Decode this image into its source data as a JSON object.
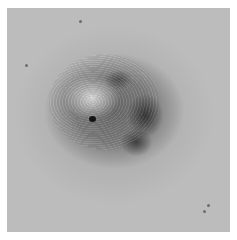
{
  "image": {
    "description": "Grayscale dermatoscopic close-up of a raised skin lesion with concentric surface ridges, a light central area, a small dark pore, and darker pigmented regions on the right",
    "colors": {
      "background": "#ffffff",
      "skin": "#b4b4b4",
      "lesion": "#6a6a6a",
      "pigment": "#1e1e1e"
    }
  }
}
